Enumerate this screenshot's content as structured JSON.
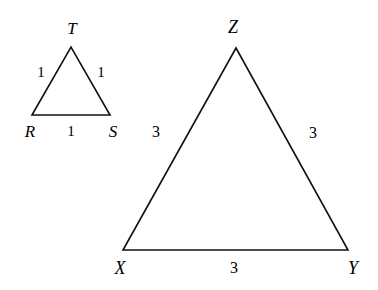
{
  "figure": {
    "background_color": "#ffffff",
    "stroke_color": "#111111",
    "stroke_width": 1.6,
    "width": 378,
    "height": 290
  },
  "triangles": [
    {
      "id": "small",
      "name": "triangle-RST",
      "vertices": [
        {
          "label": "R",
          "x": 32,
          "y": 115,
          "label_x": 30,
          "label_y": 131
        },
        {
          "label": "S",
          "x": 110,
          "y": 115,
          "label_x": 113,
          "label_y": 131
        },
        {
          "label": "T",
          "x": 71,
          "y": 47,
          "label_x": 72,
          "label_y": 28
        }
      ],
      "sides": [
        {
          "name": "RT",
          "value": "1",
          "label_x": 41,
          "label_y": 72
        },
        {
          "name": "TS",
          "value": "1",
          "label_x": 101,
          "label_y": 72
        },
        {
          "name": "RS",
          "value": "1",
          "label_x": 71,
          "label_y": 131
        }
      ],
      "path": "M 32,115 L 71,47 L 110,115 Z"
    },
    {
      "id": "large",
      "name": "triangle-XYZ",
      "vertices": [
        {
          "label": "X",
          "x": 123,
          "y": 250,
          "label_x": 120,
          "label_y": 268
        },
        {
          "label": "Y",
          "x": 348,
          "y": 250,
          "label_x": 353,
          "label_y": 268
        },
        {
          "label": "Z",
          "x": 236,
          "y": 48,
          "label_x": 233,
          "label_y": 27
        }
      ],
      "sides": [
        {
          "name": "XZ",
          "value": "3",
          "label_x": 156,
          "label_y": 132
        },
        {
          "name": "ZY",
          "value": "3",
          "label_x": 313,
          "label_y": 133
        },
        {
          "name": "XY",
          "value": "3",
          "label_x": 234,
          "label_y": 268
        }
      ],
      "path": "M 123,250 L 236,48 L 348,250 Z"
    }
  ]
}
